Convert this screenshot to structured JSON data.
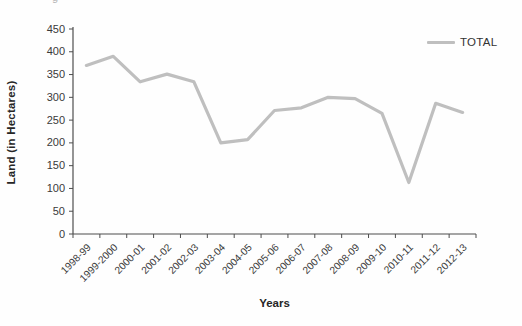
{
  "artifacts": {
    "cropped_text_fragment": "g"
  },
  "colors": {
    "series_line": "#BFBFBF",
    "axis_line": "#4d4d4d",
    "tick_text": "#3a3a3a",
    "title_text": "#262626",
    "background": "#fefefe"
  },
  "chart_data": {
    "type": "line",
    "title": "",
    "xlabel": "Years",
    "ylabel": "Land (in Hectares)",
    "categories": [
      "1998-99",
      "1999-2000",
      "2000-01",
      "2001-02",
      "2002-03",
      "2003-04",
      "2004-05",
      "2005-06",
      "2006-07",
      "2007-08",
      "2008-09",
      "2009-10",
      "2010-11",
      "2011-12",
      "2012-13"
    ],
    "series": [
      {
        "name": "TOTAL",
        "color": "#BFBFBF",
        "values": [
          370,
          390,
          334,
          351,
          334,
          200,
          207,
          271,
          277,
          300,
          297,
          265,
          113,
          287,
          267
        ]
      }
    ],
    "ylim": [
      0,
      450
    ],
    "yticks": [
      0,
      50,
      100,
      150,
      200,
      250,
      300,
      350,
      400,
      450
    ],
    "grid": false,
    "legend_position": "top-right"
  }
}
